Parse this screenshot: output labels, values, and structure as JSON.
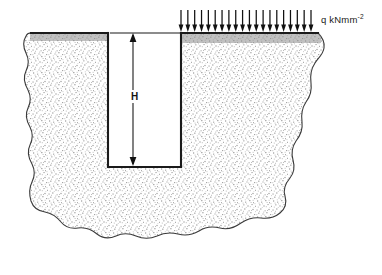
{
  "figure": {
    "type": "engineering-cross-section",
    "background_color": "#ffffff",
    "line_color": "#1a1a1a",
    "fill_color": "#cfcfcf",
    "fill_pattern": "stipple"
  },
  "labels": {
    "load": {
      "text": "q kNmm",
      "exponent": "-2",
      "full": "q kNmm-2",
      "name": "distributed-load-label"
    },
    "depth": {
      "text": "H",
      "name": "trench-depth-label"
    }
  },
  "load_arrows": {
    "count": 20,
    "direction": "down",
    "x_start": 181,
    "x_end": 311,
    "y_top": 10,
    "y_bottom": 32,
    "name": "distributed-load-arrows"
  },
  "dimension": {
    "name": "depth-dimension-line",
    "x": 133,
    "y_top": 33,
    "y_bottom": 166,
    "arrowheads": "both",
    "extension_line": {
      "x_start": 110,
      "x_end": 181,
      "y": 33
    }
  },
  "trench": {
    "name": "trench-excavation",
    "left_wall_x": 108,
    "right_wall_x": 181,
    "top_y": 33,
    "bottom_y": 167
  },
  "ground_surface": {
    "left_segment": {
      "x_start": 30,
      "x_end": 108,
      "y": 33
    },
    "right_segment": {
      "x_start": 181,
      "x_end": 318,
      "y": 33
    }
  }
}
